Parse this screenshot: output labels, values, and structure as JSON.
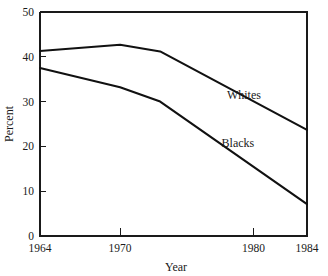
{
  "chart_data": {
    "type": "line",
    "title": "",
    "xlabel": "Year",
    "ylabel": "Percent",
    "xlim": [
      1964,
      1984
    ],
    "ylim": [
      0,
      50
    ],
    "grid": false,
    "legend_position": "inline-right",
    "x_ticks": [
      {
        "value": 1964,
        "label": "1964"
      },
      {
        "value": 1970,
        "label": "1970"
      },
      {
        "value": 1980,
        "label": "1980"
      },
      {
        "value": 1984,
        "label": "1984"
      }
    ],
    "y_ticks": [
      {
        "value": 0,
        "label": "0"
      },
      {
        "value": 10,
        "label": "10"
      },
      {
        "value": 20,
        "label": "20"
      },
      {
        "value": 30,
        "label": "30"
      },
      {
        "value": 40,
        "label": "40"
      },
      {
        "value": 50,
        "label": "50"
      }
    ],
    "series": [
      {
        "name": "Whites",
        "label": "Whites",
        "color": "#111111",
        "x": [
          1964,
          1970,
          1973,
          1984
        ],
        "values": [
          41.3,
          42.7,
          41.2,
          23.7
        ],
        "annotation": {
          "text": "Whites",
          "x": 1978.0,
          "y": 30.5
        }
      },
      {
        "name": "Blacks",
        "label": "Blacks",
        "color": "#111111",
        "x": [
          1964,
          1970,
          1973,
          1984
        ],
        "values": [
          37.5,
          33.2,
          30.0,
          7.1
        ],
        "annotation": {
          "text": "Blacks",
          "x": 1977.6,
          "y": 19.8
        }
      }
    ]
  }
}
